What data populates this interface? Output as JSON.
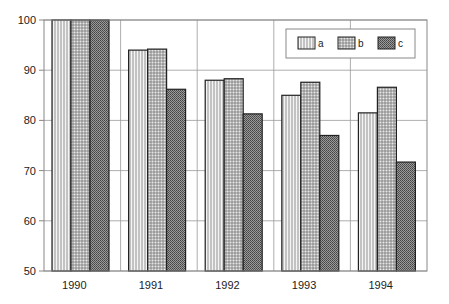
{
  "chart_data": {
    "type": "bar",
    "title": "",
    "xlabel": "",
    "ylabel": "",
    "categories": [
      "1990",
      "1991",
      "1992",
      "1993",
      "1994"
    ],
    "series": [
      {
        "name": "a",
        "pattern": "vertical-lines",
        "values": [
          100,
          94,
          88,
          85,
          81.5
        ]
      },
      {
        "name": "b",
        "pattern": "grid",
        "values": [
          100,
          94.2,
          88.3,
          87.6,
          86.6
        ]
      },
      {
        "name": "c",
        "pattern": "dense-checker",
        "values": [
          100,
          86.2,
          81.3,
          77,
          71.7
        ]
      }
    ],
    "ylim": [
      50,
      100
    ],
    "yticks": [
      "50",
      "60",
      "70",
      "80",
      "90",
      "100"
    ],
    "grid": true,
    "legend_position": "upper-right-inside"
  }
}
